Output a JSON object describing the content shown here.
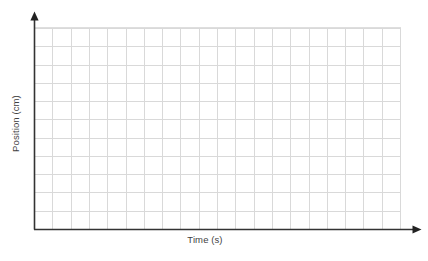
{
  "chart_data": {
    "type": "line",
    "title": "",
    "subtitle": "",
    "xlabel": "Time (s)",
    "ylabel": "Position (cm)",
    "series": [],
    "categories": [],
    "x": [],
    "values": [],
    "xtick_labels": [],
    "ytick_labels": [],
    "grid": true,
    "grid_columns": 20,
    "grid_rows": 11,
    "legend": false,
    "legend_position": "none",
    "annotations": [],
    "note": "Blank graph template with empty grid; no data plotted, no numeric tick labels."
  },
  "graph": {
    "x_axis_label": "Time (s)",
    "y_axis_label": "Position (cm)",
    "grid_columns": 20,
    "grid_rows": 11,
    "colors": {
      "background": "#ffffff",
      "grid_line": "#d9d9d9",
      "axis_line": "#333333",
      "label_text": "#3f3f3f"
    },
    "icons": {
      "y_axis_arrow": "arrow-up-icon",
      "x_axis_arrow": "arrow-right-icon"
    }
  }
}
